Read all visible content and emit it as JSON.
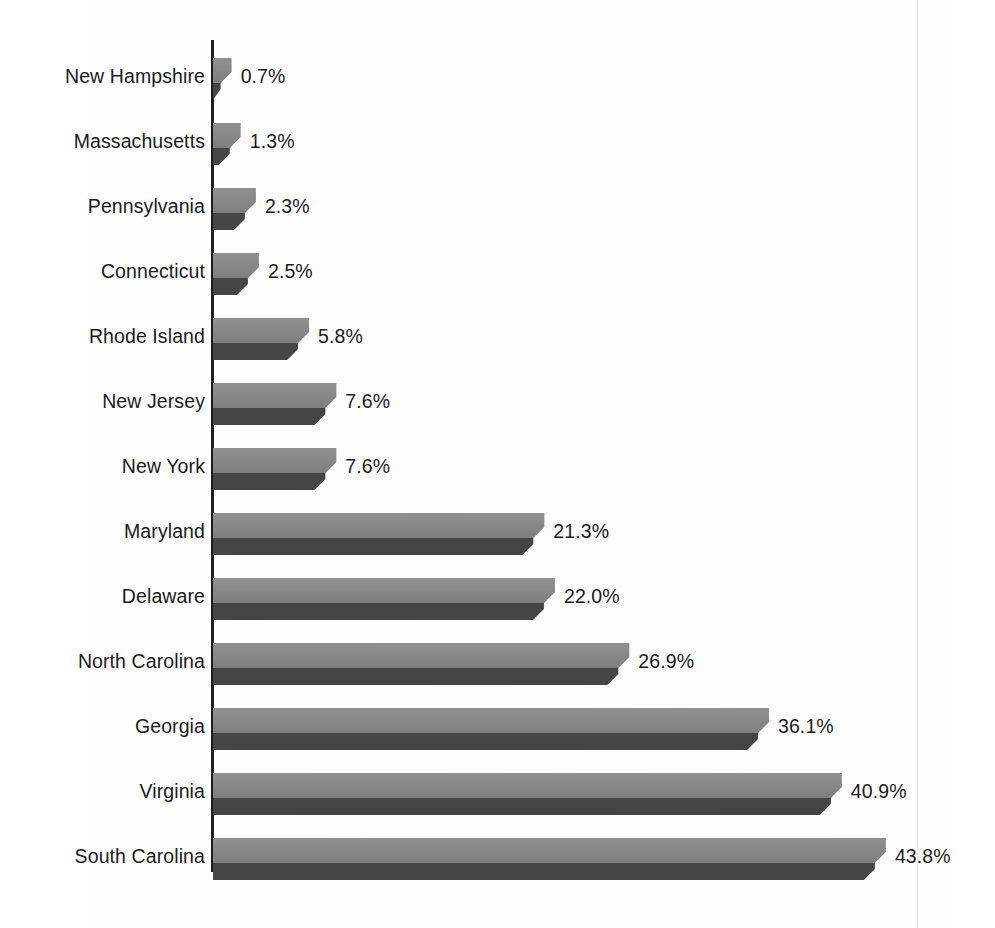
{
  "figure": {
    "kind": "horizontal-bar-chart",
    "background_color": "#fdfdfd",
    "axis_color": "#1d1d1d",
    "bar_top_face_color": "#8a8a8a",
    "bar_bottom_face_color": "#454545",
    "bar_bevel_color": "#6b6b6b",
    "label_color": "#1a1a1a"
  },
  "chart_data": {
    "type": "bar",
    "orientation": "horizontal",
    "title": "",
    "subtitle": "",
    "xlabel": "",
    "ylabel": "",
    "grid": false,
    "legend": false,
    "value_suffix": "%",
    "xlim": [
      0,
      43.8
    ],
    "categories": [
      "New Hampshire",
      "Massachusetts",
      "Pennsylvania",
      "Connecticut",
      "Rhode Island",
      "New Jersey",
      "New York",
      "Maryland",
      "Delaware",
      "North Carolina",
      "Georgia",
      "Virginia",
      "South Carolina"
    ],
    "values": [
      0.7,
      1.3,
      2.3,
      2.5,
      5.8,
      7.6,
      7.6,
      21.3,
      22.0,
      26.9,
      36.1,
      40.9,
      43.8
    ],
    "data_labels": [
      "0.7%",
      "1.3%",
      "2.3%",
      "2.5%",
      "5.8%",
      "7.6%",
      "7.6%",
      "21.3%",
      "22.0%",
      "26.9%",
      "36.1%",
      "40.9%",
      "43.8%"
    ]
  }
}
